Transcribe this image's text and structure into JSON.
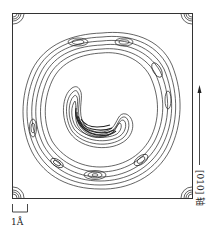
{
  "figure": {
    "title": "",
    "axis_label": "[010] 轴",
    "axis_direction": "up",
    "scale_bar_label": "1Å",
    "colors": {
      "line": "#222222",
      "frame": "#333333",
      "background": "#ffffff"
    }
  }
}
